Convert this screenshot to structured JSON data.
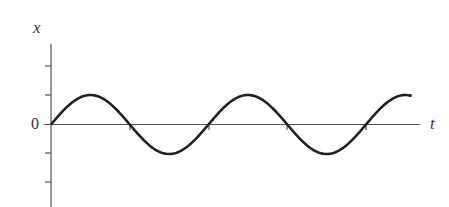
{
  "chart_data": {
    "type": "line",
    "title": "",
    "xlabel": "t",
    "ylabel": "x",
    "origin_label": "0",
    "function": "x = A sin(2π t / T)",
    "amplitude_ticks": 1,
    "y_ticks": [
      -2,
      -1,
      0,
      1,
      2
    ],
    "periods_shown": 2.3,
    "zero_crossings_t": [
      0,
      0.5,
      1.0,
      1.5,
      2.0
    ],
    "series": [
      {
        "name": "x(t)",
        "shape": "sine",
        "amplitude": 1,
        "period": 1,
        "t_start": 0,
        "t_end": 2.29
      }
    ],
    "grid": false,
    "legend": "none"
  },
  "labels": {
    "x_axis": "t",
    "y_axis": "x",
    "origin": "0"
  },
  "colors": {
    "curve": "#222222",
    "axis": "#555555",
    "text": "#333333"
  }
}
